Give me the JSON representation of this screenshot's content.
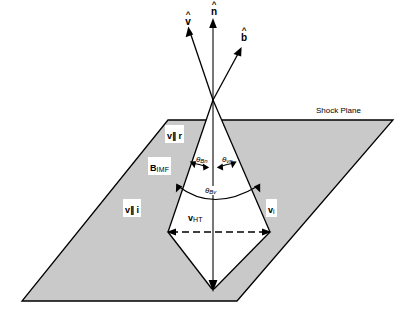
{
  "figure": {
    "background": "#ffffff",
    "plane_fill": "#c8c8c8",
    "line_color": "#000000"
  },
  "plane": {
    "label": "Shock Plane"
  },
  "unit_vectors": [
    {
      "name": "v-hat",
      "hat": "^",
      "letter": "v"
    },
    {
      "name": "n-hat",
      "hat": "^",
      "letter": "n"
    },
    {
      "name": "b-hat",
      "hat": "^",
      "letter": "b"
    }
  ],
  "vectors": {
    "v_par_r": {
      "symbol": "v",
      "sub": "∥ r"
    },
    "b_imf": {
      "symbol": "B",
      "sub": "IMF"
    },
    "v_par_i": {
      "symbol": "v",
      "sub": "∥ i"
    },
    "v_ht": {
      "symbol": "v",
      "sub": "HT"
    },
    "v_i": {
      "symbol": "v",
      "sub": "i"
    }
  },
  "angles": {
    "theta_bn": {
      "symbol": "θ",
      "sub": "Bn"
    },
    "theta_vn": {
      "symbol": "θ",
      "sub": "vn"
    },
    "theta_bv": {
      "symbol": "θ",
      "sub": "Bv"
    }
  }
}
